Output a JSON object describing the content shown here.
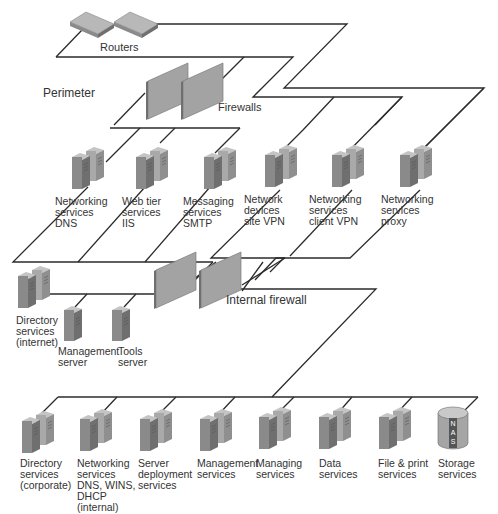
{
  "zones": {
    "perimeter": "Perimeter",
    "internal_firewall": "Internal firewall"
  },
  "devices": {
    "routers": {
      "label": "Routers",
      "icon": "router-icon",
      "count": 2
    },
    "firewalls": {
      "label": "Firewalls",
      "icon": "firewall-icon",
      "count": 2
    },
    "internal_firewalls": {
      "icon": "firewall-icon",
      "count": 2
    }
  },
  "perimeter_servers": [
    {
      "label": "Networking\nservices\nDNS",
      "icon": "server-pair-icon"
    },
    {
      "label": "Web tier\nservices\nIIS",
      "icon": "server-pair-icon"
    },
    {
      "label": "Messaging\nservices\nSMTP",
      "icon": "server-pair-icon"
    },
    {
      "label": "Network\ndevices\nsite VPN",
      "icon": "server-pair-icon"
    },
    {
      "label": "Networking\nservices\nclient VPN",
      "icon": "server-pair-icon"
    },
    {
      "label": "Networking\nservices\nproxy",
      "icon": "server-pair-icon"
    }
  ],
  "dmz_servers": [
    {
      "label": "Directory\nservices\n(internet)",
      "icon": "server-pair-icon"
    },
    {
      "label": "Management\nserver",
      "icon": "server-icon"
    },
    {
      "label": "Tools\nserver",
      "icon": "server-icon"
    }
  ],
  "internal_servers": [
    {
      "label": "Directory\nservices\n(corporate)",
      "icon": "server-pair-icon"
    },
    {
      "label": "Networking\nservices\nDNS, WINS,\nDHCP\n(internal)",
      "icon": "server-pair-icon"
    },
    {
      "label": "Server\ndeployment\nservices",
      "icon": "server-pair-icon"
    },
    {
      "label": "Management\nservices",
      "icon": "server-pair-icon"
    },
    {
      "label": "Managing\nservices",
      "icon": "server-pair-icon"
    },
    {
      "label": "Data\nservices",
      "icon": "server-pair-icon"
    },
    {
      "label": "File & print\nservices",
      "icon": "server-pair-icon"
    },
    {
      "label": "Storage\nservices",
      "icon": "nas-icon",
      "badge": "NAS"
    }
  ],
  "colors": {
    "line": "#2b2b2b",
    "server_front": "#8a8a8a",
    "server_side": "#a9a9a9",
    "server_top": "#c4c4c4",
    "firewall": "#a0a0a0",
    "nas_body": "#a5a5a5",
    "nas_stripe": "#555555"
  }
}
